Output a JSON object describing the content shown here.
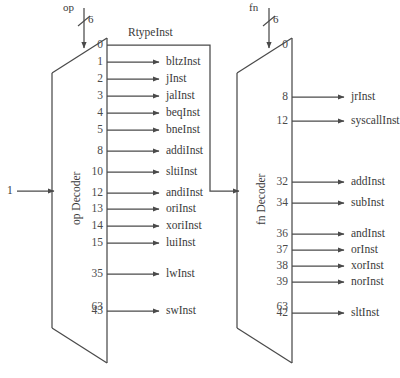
{
  "figure": {
    "line_color": "#4a4a4a",
    "text_color": "#3a3a3a",
    "background": "#ffffff"
  },
  "decoders": [
    {
      "id": "op-decoder",
      "name": "op Decoder",
      "input_port": "op",
      "bus_width": "6",
      "enable_label": "1",
      "first_pin": "0",
      "last_pin": "63",
      "outputs": [
        {
          "pin": "1",
          "label": "bltzInst"
        },
        {
          "pin": "2",
          "label": "jInst"
        },
        {
          "pin": "3",
          "label": "jalInst"
        },
        {
          "pin": "4",
          "label": "beqInst"
        },
        {
          "pin": "5",
          "label": "bneInst"
        },
        {
          "pin": "8",
          "label": "addiInst"
        },
        {
          "pin": "10",
          "label": "sltiInst"
        },
        {
          "pin": "12",
          "label": "andiInst"
        },
        {
          "pin": "13",
          "label": "oriInst"
        },
        {
          "pin": "14",
          "label": "xoriInst"
        },
        {
          "pin": "15",
          "label": "luiInst"
        },
        {
          "pin": "35",
          "label": "lwInst"
        },
        {
          "pin": "43",
          "label": "swInst"
        }
      ],
      "pin0_output": "RtypeInst"
    },
    {
      "id": "fn-decoder",
      "name": "fn Decoder",
      "input_port": "fn",
      "bus_width": "6",
      "first_pin": "0",
      "last_pin": "63",
      "outputs": [
        {
          "pin": "8",
          "label": "jrInst"
        },
        {
          "pin": "12",
          "label": "syscallInst"
        },
        {
          "pin": "32",
          "label": "addInst"
        },
        {
          "pin": "34",
          "label": "subInst"
        },
        {
          "pin": "36",
          "label": "andInst"
        },
        {
          "pin": "37",
          "label": "orInst"
        },
        {
          "pin": "38",
          "label": "xorInst"
        },
        {
          "pin": "39",
          "label": "norInst"
        },
        {
          "pin": "42",
          "label": "sltInst"
        }
      ]
    }
  ],
  "signals": {
    "rtype_name": "RtypeInst",
    "constant_one": "1"
  }
}
